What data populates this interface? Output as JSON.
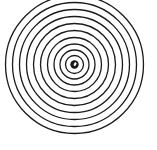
{
  "figure": {
    "center": {
      "x": 74.5,
      "y": 64.5
    },
    "stroke_color": "#1a1a1a",
    "background": "#ffffff",
    "ring_radii": [
      9,
      14.5,
      20.5,
      27,
      34,
      41,
      48,
      55,
      62,
      69
    ],
    "ring_stroke_width": 1.3,
    "center_dot": {
      "radius": 4.2,
      "highlight_radius": 1.2
    }
  }
}
